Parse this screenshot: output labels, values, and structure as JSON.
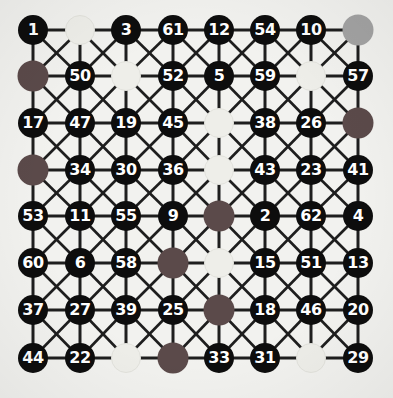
{
  "graph": {
    "title": "numbered grid graph",
    "rows": 8,
    "cols": 8,
    "colors": {
      "background": "#f2f2ef",
      "edge": "#1e1e1e",
      "node_dark": "#0d0d0d",
      "node_label": "#ffffff",
      "node_cream": "#eeeee9",
      "node_maroon": "#5b4a4a",
      "node_gray": "#a3a3a3"
    },
    "column_x": [
      33,
      80,
      126,
      173,
      219,
      265,
      311,
      358
    ],
    "row_y": [
      30,
      76,
      123,
      170,
      216,
      263,
      310,
      358
    ],
    "nodes": [
      [
        {
          "label": "1",
          "kind": "dark"
        },
        {
          "label": "",
          "kind": "cream"
        },
        {
          "label": "3",
          "kind": "dark"
        },
        {
          "label": "61",
          "kind": "dark"
        },
        {
          "label": "12",
          "kind": "dark"
        },
        {
          "label": "54",
          "kind": "dark"
        },
        {
          "label": "10",
          "kind": "dark"
        },
        {
          "label": "",
          "kind": "gray"
        }
      ],
      [
        {
          "label": "",
          "kind": "maroon"
        },
        {
          "label": "50",
          "kind": "dark"
        },
        {
          "label": "",
          "kind": "cream"
        },
        {
          "label": "52",
          "kind": "dark"
        },
        {
          "label": "5",
          "kind": "dark"
        },
        {
          "label": "59",
          "kind": "dark"
        },
        {
          "label": "",
          "kind": "cream"
        },
        {
          "label": "57",
          "kind": "dark"
        }
      ],
      [
        {
          "label": "17",
          "kind": "dark"
        },
        {
          "label": "47",
          "kind": "dark"
        },
        {
          "label": "19",
          "kind": "dark"
        },
        {
          "label": "45",
          "kind": "dark"
        },
        {
          "label": "",
          "kind": "cream"
        },
        {
          "label": "38",
          "kind": "dark"
        },
        {
          "label": "26",
          "kind": "dark"
        },
        {
          "label": "",
          "kind": "maroon"
        }
      ],
      [
        {
          "label": "",
          "kind": "maroon"
        },
        {
          "label": "34",
          "kind": "dark"
        },
        {
          "label": "30",
          "kind": "dark"
        },
        {
          "label": "36",
          "kind": "dark"
        },
        {
          "label": "",
          "kind": "cream"
        },
        {
          "label": "43",
          "kind": "dark"
        },
        {
          "label": "23",
          "kind": "dark"
        },
        {
          "label": "41",
          "kind": "dark"
        }
      ],
      [
        {
          "label": "53",
          "kind": "dark"
        },
        {
          "label": "11",
          "kind": "dark"
        },
        {
          "label": "55",
          "kind": "dark"
        },
        {
          "label": "9",
          "kind": "dark"
        },
        {
          "label": "",
          "kind": "maroon"
        },
        {
          "label": "2",
          "kind": "dark"
        },
        {
          "label": "62",
          "kind": "dark"
        },
        {
          "label": "4",
          "kind": "dark"
        }
      ],
      [
        {
          "label": "60",
          "kind": "dark"
        },
        {
          "label": "6",
          "kind": "dark"
        },
        {
          "label": "58",
          "kind": "dark"
        },
        {
          "label": "",
          "kind": "maroon"
        },
        {
          "label": "",
          "kind": "cream"
        },
        {
          "label": "15",
          "kind": "dark"
        },
        {
          "label": "51",
          "kind": "dark"
        },
        {
          "label": "13",
          "kind": "dark"
        }
      ],
      [
        {
          "label": "37",
          "kind": "dark"
        },
        {
          "label": "27",
          "kind": "dark"
        },
        {
          "label": "39",
          "kind": "dark"
        },
        {
          "label": "25",
          "kind": "dark"
        },
        {
          "label": "",
          "kind": "maroon"
        },
        {
          "label": "18",
          "kind": "dark"
        },
        {
          "label": "46",
          "kind": "dark"
        },
        {
          "label": "20",
          "kind": "dark"
        }
      ],
      [
        {
          "label": "44",
          "kind": "dark"
        },
        {
          "label": "22",
          "kind": "dark"
        },
        {
          "label": "",
          "kind": "cream"
        },
        {
          "label": "",
          "kind": "maroon"
        },
        {
          "label": "33",
          "kind": "dark"
        },
        {
          "label": "31",
          "kind": "dark"
        },
        {
          "label": "",
          "kind": "cream"
        },
        {
          "label": "29",
          "kind": "dark"
        }
      ]
    ],
    "edge_rules": {
      "horizontal": true,
      "vertical": true,
      "diagonal_down_right": true,
      "diagonal_down_left": true
    }
  }
}
